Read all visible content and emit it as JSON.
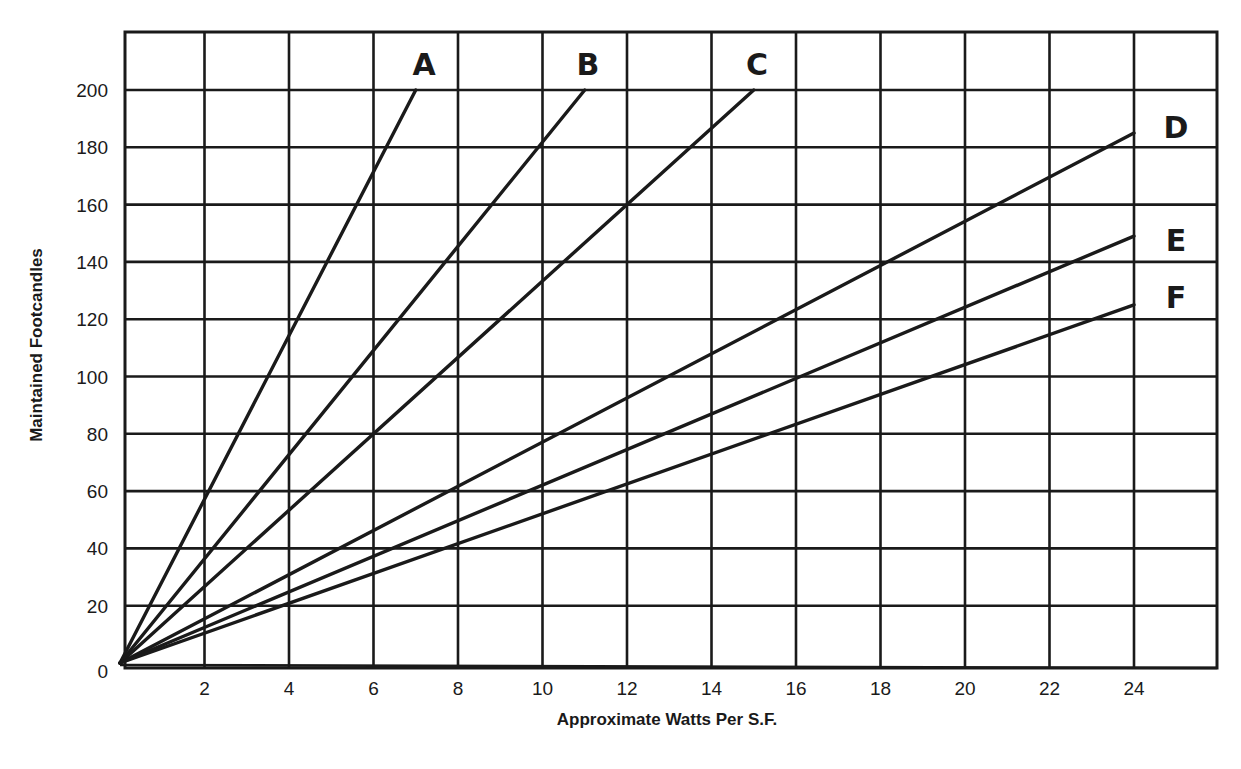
{
  "chart_data": {
    "type": "line",
    "title": "",
    "xlabel": "Approximate Watts Per S.F.",
    "ylabel": "Maintained Footcandles",
    "xlim": [
      0,
      26
    ],
    "ylim": [
      0,
      220
    ],
    "x_ticks": [
      2,
      4,
      6,
      8,
      10,
      12,
      14,
      16,
      18,
      20,
      22,
      24
    ],
    "y_ticks": [
      0,
      20,
      40,
      60,
      80,
      100,
      120,
      140,
      160,
      180,
      200
    ],
    "grid": true,
    "legend_position": "inline labels at line ends (top and right)",
    "series": [
      {
        "name": "A",
        "x": [
          0,
          7
        ],
        "values": [
          0,
          200
        ]
      },
      {
        "name": "B",
        "x": [
          0,
          11
        ],
        "values": [
          0,
          200
        ]
      },
      {
        "name": "C",
        "x": [
          0,
          15
        ],
        "values": [
          0,
          200
        ]
      },
      {
        "name": "D",
        "x": [
          0,
          24
        ],
        "values": [
          0,
          185
        ]
      },
      {
        "name": "E",
        "x": [
          0,
          24
        ],
        "values": [
          0,
          149
        ]
      },
      {
        "name": "F",
        "x": [
          0,
          24
        ],
        "values": [
          0,
          125
        ]
      }
    ]
  },
  "labels": {
    "x_axis_title": "Approximate Watts Per S.F.",
    "y_axis_title": "Maintained Footcandles",
    "origin": "0"
  },
  "colors": {
    "ink": "#1a1a1a",
    "background": "#ffffff"
  }
}
